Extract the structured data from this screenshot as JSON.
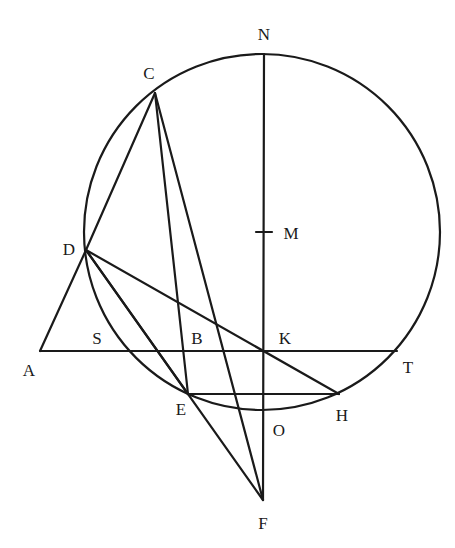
{
  "diagram": {
    "type": "geometry-construction",
    "circle": {
      "center": "M",
      "cx": 262,
      "cy": 232,
      "r": 178
    },
    "points": {
      "N": {
        "x": 264,
        "y": 54,
        "lx": 264,
        "ly": 40,
        "label": "N"
      },
      "M": {
        "x": 264,
        "y": 232,
        "lx": 291,
        "ly": 239,
        "label": "M"
      },
      "C": {
        "x": 155,
        "y": 93,
        "lx": 149,
        "ly": 79,
        "label": "C"
      },
      "D": {
        "x": 86,
        "y": 250,
        "lx": 69,
        "ly": 255,
        "label": "D"
      },
      "A": {
        "x": 40,
        "y": 351,
        "lx": 29,
        "ly": 376,
        "label": "A"
      },
      "S": {
        "x": 97,
        "y": 351,
        "lx": 97,
        "ly": 344,
        "label": "S"
      },
      "B": {
        "x": 197,
        "y": 351,
        "lx": 197,
        "ly": 344,
        "label": "B"
      },
      "K": {
        "x": 264,
        "y": 351,
        "lx": 285,
        "ly": 344,
        "label": "K"
      },
      "T": {
        "x": 397,
        "y": 351,
        "lx": 408,
        "ly": 373,
        "label": "T"
      },
      "E": {
        "x": 188,
        "y": 394,
        "lx": 181,
        "ly": 415,
        "label": "E"
      },
      "H": {
        "x": 339,
        "y": 394,
        "lx": 342,
        "ly": 421,
        "label": "H"
      },
      "O": {
        "x": 264,
        "y": 412,
        "lx": 279,
        "ly": 436,
        "label": "O"
      },
      "F": {
        "x": 263,
        "y": 500,
        "lx": 263,
        "ly": 529,
        "label": "F"
      }
    },
    "segments": [
      [
        "C",
        "D"
      ],
      [
        "D",
        "A"
      ],
      [
        "A",
        "T"
      ],
      [
        "D",
        "H"
      ],
      [
        "D",
        "E"
      ],
      [
        "D",
        "F"
      ],
      [
        "C",
        "E"
      ],
      [
        "C",
        "F"
      ],
      [
        "E",
        "H"
      ],
      [
        "N",
        "F"
      ]
    ],
    "labels": [
      "N",
      "M",
      "C",
      "D",
      "A",
      "S",
      "B",
      "K",
      "T",
      "E",
      "H",
      "O",
      "F"
    ]
  }
}
